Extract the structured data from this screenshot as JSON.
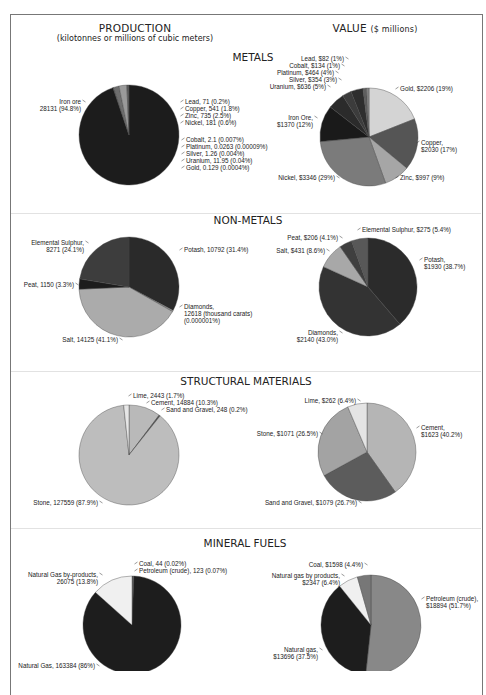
{
  "headers": {
    "production_title": "PRODUCTION",
    "production_subtitle": "(kilotonnes or millions of cubic meters)",
    "value_title": "VALUE",
    "value_subtitle": "($ millions)"
  },
  "sections": [
    {
      "title": "METALS"
    },
    {
      "title": "NON-METALS"
    },
    {
      "title": "STRUCTURAL MATERIALS"
    },
    {
      "title": "MINERAL FUELS"
    }
  ],
  "chart_data": [
    {
      "type": "pie",
      "section": "METALS",
      "panel": "PRODUCTION",
      "title": "Metals production (kilotonnes)",
      "categories": [
        "Iron ore",
        "Lead",
        "Copper",
        "Zinc",
        "Nickel",
        "Cobalt",
        "Platinum",
        "Silver",
        "Uranium",
        "Gold"
      ],
      "values": [
        28131,
        71,
        541,
        735,
        181,
        2.1,
        0.0263,
        1.26,
        11.95,
        0.129
      ],
      "percents": [
        "94.8%",
        "0.2%",
        "1.8%",
        "2.5%",
        "0.6%",
        "0.007%",
        "0.00009%",
        "0.004%",
        "0.04%",
        "0.0004%"
      ]
    },
    {
      "type": "pie",
      "section": "METALS",
      "panel": "VALUE",
      "title": "Metals value ($ millions)",
      "categories": [
        "Gold",
        "Copper",
        "Zinc",
        "Nickel",
        "Iron Ore",
        "Uranium",
        "Silver",
        "Platinum",
        "Cobalt",
        "Lead"
      ],
      "values": [
        2206,
        2030,
        997,
        3346,
        1370,
        636,
        354,
        464,
        134,
        82
      ],
      "percents": [
        "19%",
        "17%",
        "9%",
        "29%",
        "12%",
        "5%",
        "3%",
        "4%",
        "1%",
        "1%"
      ]
    },
    {
      "type": "pie",
      "section": "NON-METALS",
      "panel": "PRODUCTION",
      "title": "Non-metals production",
      "categories": [
        "Potash",
        "Diamonds",
        "Salt",
        "Peat",
        "Elemental Sulphur"
      ],
      "values": [
        10792,
        12618,
        14125,
        1150,
        8271
      ],
      "percents": [
        "31.4%",
        "0.000001%",
        "41.1%",
        "3.3%",
        "24.1%"
      ],
      "notes": {
        "Diamonds": "thousand carats"
      }
    },
    {
      "type": "pie",
      "section": "NON-METALS",
      "panel": "VALUE",
      "title": "Non-metals value ($ millions)",
      "categories": [
        "Potash",
        "Diamonds",
        "Salt",
        "Peat",
        "Elemental Sulphur"
      ],
      "values": [
        1930,
        2140,
        431,
        206,
        275
      ],
      "percents": [
        "38.7%",
        "43.0%",
        "8.6%",
        "4.1%",
        "5.4%"
      ]
    },
    {
      "type": "pie",
      "section": "STRUCTURAL MATERIALS",
      "panel": "PRODUCTION",
      "title": "Structural materials production",
      "categories": [
        "Cement",
        "Sand and Gravel",
        "Stone",
        "Lime"
      ],
      "values": [
        14884,
        248,
        127559,
        2443
      ],
      "percents": [
        "10.3%",
        "0.2%",
        "87.9%",
        "1.7%"
      ]
    },
    {
      "type": "pie",
      "section": "STRUCTURAL MATERIALS",
      "panel": "VALUE",
      "title": "Structural materials value ($ millions)",
      "categories": [
        "Cement",
        "Sand and Gravel",
        "Stone",
        "Lime"
      ],
      "values": [
        1623,
        1079,
        1071,
        262
      ],
      "percents": [
        "40.2%",
        "26.7%",
        "26.5%",
        "6.4%"
      ]
    },
    {
      "type": "pie",
      "section": "MINERAL FUELS",
      "panel": "PRODUCTION",
      "title": "Mineral fuels production",
      "categories": [
        "Coal",
        "Petroleum (crude)",
        "Natural Gas",
        "Natural Gas by-products"
      ],
      "values": [
        44,
        123,
        163384,
        26075
      ],
      "percents": [
        "0.02%",
        "0.07%",
        "86%",
        "13.8%"
      ]
    },
    {
      "type": "pie",
      "section": "MINERAL FUELS",
      "panel": "VALUE",
      "title": "Mineral fuels value ($ millions)",
      "categories": [
        "Petroleum (crude)",
        "Natural gas",
        "Natural gas by products",
        "Coal"
      ],
      "values": [
        18894,
        13696,
        2347,
        1598
      ],
      "percents": [
        "51.7%",
        "37.5%",
        "6.4%",
        "4.4%"
      ]
    }
  ],
  "pies": [
    {
      "name": "metals-production",
      "cx": 129,
      "cy": 135,
      "r": 50,
      "slices": [
        {
          "pct": 94.8,
          "color": "#1c1c1c"
        },
        {
          "pct": 0.2,
          "color": "#4a4a4a"
        },
        {
          "pct": 1.8,
          "color": "#6e6e6e"
        },
        {
          "pct": 2.5,
          "color": "#9a9a9a"
        },
        {
          "pct": 0.7,
          "color": "#5a5a5a"
        }
      ],
      "start": 90,
      "labels": [
        {
          "lines": [
            "Iron ore",
            "28131 (94.8%)"
          ],
          "x": 81,
          "y": 104,
          "anchor": "end",
          "lx1": 82,
          "ly1": 100,
          "lx2": 86,
          "ly2": 102
        },
        {
          "lines": [
            "Lead,  71 (0.2%)"
          ],
          "x": 185,
          "y": 104,
          "anchor": "start"
        },
        {
          "lines": [
            "Copper,  541 (1.8%)"
          ],
          "x": 185,
          "y": 111,
          "anchor": "start"
        },
        {
          "lines": [
            "Zinc,  735 (2.5%)"
          ],
          "x": 185,
          "y": 118,
          "anchor": "start"
        },
        {
          "lines": [
            "Nickel,  181 (0.6%)"
          ],
          "x": 185,
          "y": 125,
          "anchor": "start"
        },
        {
          "lines": [
            "Cobalt,  2.1 (0.007%)"
          ],
          "x": 186,
          "y": 142,
          "anchor": "start"
        },
        {
          "lines": [
            "Platinum,  0.0263 (0.00009%)"
          ],
          "x": 186,
          "y": 149,
          "anchor": "start"
        },
        {
          "lines": [
            "Silver,  1.26 (0.004%)"
          ],
          "x": 186,
          "y": 156,
          "anchor": "start"
        },
        {
          "lines": [
            "Uranium,  11.95 (0.04%)"
          ],
          "x": 186,
          "y": 163,
          "anchor": "start"
        },
        {
          "lines": [
            "Gold,  0.129 (0.0004%)"
          ],
          "x": 186,
          "y": 170,
          "anchor": "start"
        }
      ]
    },
    {
      "name": "metals-value",
      "cx": 369,
      "cy": 137,
      "r": 49,
      "slices": [
        {
          "pct": 19,
          "color": "#d4d4d4"
        },
        {
          "pct": 17,
          "color": "#555555"
        },
        {
          "pct": 8.5,
          "color": "#a6a6a6"
        },
        {
          "pct": 29,
          "color": "#7b7b7b"
        },
        {
          "pct": 12,
          "color": "#1a1a1a"
        },
        {
          "pct": 5.5,
          "color": "#2b2b2b"
        },
        {
          "pct": 3,
          "color": "#3c3c3c"
        },
        {
          "pct": 4,
          "color": "#2e2e2e"
        },
        {
          "pct": 1.2,
          "color": "#5f5f5f"
        },
        {
          "pct": 0.8,
          "color": "#888888"
        }
      ],
      "start": 90,
      "labels": [
        {
          "lines": [
            "Lead, $82 (1%)"
          ],
          "x": 344,
          "y": 61,
          "anchor": "end"
        },
        {
          "lines": [
            "Cobalt, $134 (1%)"
          ],
          "x": 340,
          "y": 68,
          "anchor": "end"
        },
        {
          "lines": [
            "Platinum, $464 (4%)"
          ],
          "x": 334,
          "y": 75,
          "anchor": "end"
        },
        {
          "lines": [
            "Silver, $354 (3%)"
          ],
          "x": 337,
          "y": 82,
          "anchor": "end"
        },
        {
          "lines": [
            "Uranium, $636 (5%)"
          ],
          "x": 326,
          "y": 89,
          "anchor": "end"
        },
        {
          "lines": [
            "Gold, $2206 (19%)"
          ],
          "x": 400,
          "y": 91,
          "anchor": "start"
        },
        {
          "lines": [
            "Iron Ore,",
            "$1370 (12%)"
          ],
          "x": 313,
          "y": 120,
          "anchor": "end"
        },
        {
          "lines": [
            "Copper,",
            "$2030 (17%)"
          ],
          "x": 421,
          "y": 145,
          "anchor": "start"
        },
        {
          "lines": [
            "Nickel, $3346 (29%)"
          ],
          "x": 335,
          "y": 180,
          "anchor": "end"
        },
        {
          "lines": [
            "Zinc, $997 (9%)"
          ],
          "x": 400,
          "y": 180,
          "anchor": "start"
        }
      ]
    },
    {
      "name": "non-metals-production",
      "cx": 129,
      "cy": 287,
      "r": 50,
      "slices": [
        {
          "pct": 32.8,
          "color": "#2a2a2a"
        },
        {
          "pct": 0.4,
          "color": "#9d9d9d"
        },
        {
          "pct": 41.1,
          "color": "#ababab"
        },
        {
          "pct": 3.3,
          "color": "#1c1c1c"
        },
        {
          "pct": 22.4,
          "color": "#3d3d3d"
        }
      ],
      "start": 90,
      "labels": [
        {
          "lines": [
            "Elemental Sulphur,",
            "8271 (24.1%)"
          ],
          "x": 84,
          "y": 245,
          "anchor": "end"
        },
        {
          "lines": [
            "Potash, 10792 (31.4%)"
          ],
          "x": 184,
          "y": 252,
          "anchor": "start"
        },
        {
          "lines": [
            "Peat, 1150 (3.3%)"
          ],
          "x": 74,
          "y": 287,
          "anchor": "end"
        },
        {
          "lines": [
            "Diamonds,",
            "12618 (thousand carats)",
            "(0.000001%)"
          ],
          "x": 184,
          "y": 309,
          "anchor": "start"
        },
        {
          "lines": [
            "Salt, 14125 (41.1%)"
          ],
          "x": 118,
          "y": 342,
          "anchor": "end"
        }
      ]
    },
    {
      "name": "non-metals-value",
      "cx": 368,
      "cy": 287,
      "r": 49,
      "slices": [
        {
          "pct": 38.7,
          "color": "#2b2b2b"
        },
        {
          "pct": 43.1,
          "color": "#333333"
        },
        {
          "pct": 8.6,
          "color": "#a8a8a8"
        },
        {
          "pct": 4.1,
          "color": "#3f3f3f"
        },
        {
          "pct": 5.5,
          "color": "#585858"
        }
      ],
      "start": 90,
      "labels": [
        {
          "lines": [
            "Peat, $206 (4.1%)"
          ],
          "x": 338,
          "y": 240,
          "anchor": "end"
        },
        {
          "lines": [
            "Elemental Sulphur, $275 (5.4%)"
          ],
          "x": 362,
          "y": 232,
          "anchor": "start"
        },
        {
          "lines": [
            "Salt, $431 (8.6%)"
          ],
          "x": 325,
          "y": 253,
          "anchor": "end"
        },
        {
          "lines": [
            "Potash,",
            "$1930 (38.7%)"
          ],
          "x": 424,
          "y": 262,
          "anchor": "start"
        },
        {
          "lines": [
            "Diamonds,",
            "$2140 (43.0%)"
          ],
          "x": 338,
          "y": 335,
          "anchor": "end"
        }
      ]
    },
    {
      "name": "structural-production",
      "cx": 129,
      "cy": 455,
      "r": 50,
      "slices": [
        {
          "pct": 10.3,
          "color": "#b9b9b9"
        },
        {
          "pct": 0.4,
          "color": "#555555"
        },
        {
          "pct": 87.6,
          "color": "#bdbdbd"
        },
        {
          "pct": 1.7,
          "color": "#e6e6e6"
        }
      ],
      "start": 90,
      "labels": [
        {
          "lines": [
            "Lime, 2443 (1.7%)"
          ],
          "x": 133,
          "y": 398,
          "anchor": "start"
        },
        {
          "lines": [
            "Cement, 14884 (10.3%)"
          ],
          "x": 151,
          "y": 405,
          "anchor": "start"
        },
        {
          "lines": [
            "Sand and Gravel, 248 (0.2%)"
          ],
          "x": 166,
          "y": 412,
          "anchor": "start"
        },
        {
          "lines": [
            "Stone, 127559 (87.9%)"
          ],
          "x": 98,
          "y": 505,
          "anchor": "end"
        }
      ]
    },
    {
      "name": "structural-value",
      "cx": 367,
      "cy": 452,
      "r": 49,
      "slices": [
        {
          "pct": 40.2,
          "color": "#b5b5b5"
        },
        {
          "pct": 26.8,
          "color": "#5c5c5c"
        },
        {
          "pct": 26.6,
          "color": "#a3a3a3"
        },
        {
          "pct": 6.4,
          "color": "#e4e4e4"
        }
      ],
      "start": 90,
      "labels": [
        {
          "lines": [
            "Lime, $262 (6.4%)"
          ],
          "x": 356,
          "y": 403,
          "anchor": "end"
        },
        {
          "lines": [
            "Cement,",
            "$1623 (40.2%)"
          ],
          "x": 421,
          "y": 430,
          "anchor": "start"
        },
        {
          "lines": [
            "Stone, $1071 (26.5%)"
          ],
          "x": 318,
          "y": 436,
          "anchor": "end"
        },
        {
          "lines": [
            "Sand and Gravel, $1079 (26.7%)"
          ],
          "x": 357,
          "y": 505,
          "anchor": "end"
        }
      ]
    },
    {
      "name": "fuels-production",
      "cx": 132,
      "cy": 625,
      "r": 49,
      "slices": [
        {
          "pct": 0.3,
          "color": "#555555"
        },
        {
          "pct": 0.3,
          "color": "#888888"
        },
        {
          "pct": 86,
          "color": "#1d1d1d"
        },
        {
          "pct": 13.4,
          "color": "#f0f0f0"
        }
      ],
      "start": 90,
      "labels": [
        {
          "lines": [
            "Coal, 44 (0.02%)"
          ],
          "x": 139,
          "y": 566,
          "anchor": "start"
        },
        {
          "lines": [
            "Petroleum (crude), 123 (0.07%)"
          ],
          "x": 139,
          "y": 573,
          "anchor": "start"
        },
        {
          "lines": [
            "Natural Gas by-products,",
            "26075 (13.8%)"
          ],
          "x": 98,
          "y": 577,
          "anchor": "end"
        },
        {
          "lines": [
            "Natural Gas, 163384 (86%)"
          ],
          "x": 95,
          "y": 668,
          "anchor": "end"
        }
      ]
    },
    {
      "name": "fuels-value",
      "cx": 371,
      "cy": 625,
      "r": 50,
      "slices": [
        {
          "pct": 51.7,
          "color": "#888888"
        },
        {
          "pct": 37.5,
          "color": "#1d1d1d"
        },
        {
          "pct": 6.4,
          "color": "#f0f0f0"
        },
        {
          "pct": 4.4,
          "color": "#777777"
        }
      ],
      "start": 90,
      "labels": [
        {
          "lines": [
            "Coal, $1598 (4.4%)"
          ],
          "x": 363,
          "y": 567,
          "anchor": "end"
        },
        {
          "lines": [
            "Natural gas by products,",
            "$2347 (6.4%)"
          ],
          "x": 340,
          "y": 578,
          "anchor": "end"
        },
        {
          "lines": [
            "Petroleum (crude),",
            "$18894 (51.7%)"
          ],
          "x": 426,
          "y": 601,
          "anchor": "start"
        },
        {
          "lines": [
            "Natural gas,",
            "$13696 (37.5%)"
          ],
          "x": 318,
          "y": 652,
          "anchor": "end"
        }
      ]
    }
  ]
}
